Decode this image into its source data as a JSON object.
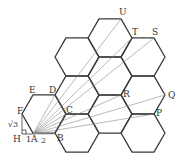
{
  "diagram": {
    "hex_edge": 22,
    "hex_centers": [
      [
        44,
        114
      ],
      [
        77,
        57
      ],
      [
        77,
        95
      ],
      [
        77,
        133
      ],
      [
        110,
        38
      ],
      [
        110,
        76
      ],
      [
        110,
        114
      ],
      [
        143,
        57
      ],
      [
        143,
        95
      ],
      [
        143,
        133
      ]
    ],
    "origin": {
      "label": "A",
      "x": 33,
      "y": 134
    },
    "points": [
      {
        "label": "B",
        "x": 55,
        "y": 134,
        "lx": 57,
        "ly": 141
      },
      {
        "label": "C",
        "x": 66,
        "y": 114,
        "lx": 66,
        "ly": 113
      },
      {
        "label": "D",
        "x": 55,
        "y": 95,
        "lx": 49,
        "ly": 93
      },
      {
        "label": "E",
        "x": 33,
        "y": 95,
        "lx": 29,
        "ly": 93
      },
      {
        "label": "F",
        "x": 22,
        "y": 114,
        "lx": 17,
        "ly": 114
      },
      {
        "label": "P",
        "x": 154,
        "y": 114,
        "lx": 156,
        "ly": 116
      },
      {
        "label": "Q",
        "x": 165,
        "y": 95,
        "lx": 168,
        "ly": 98
      },
      {
        "label": "R",
        "x": 121,
        "y": 95,
        "lx": 123,
        "ly": 97
      },
      {
        "label": "S",
        "x": 154,
        "y": 38,
        "lx": 152,
        "ly": 35
      },
      {
        "label": "T",
        "x": 132,
        "y": 38,
        "lx": 132,
        "ly": 35
      },
      {
        "label": "U",
        "x": 121,
        "y": 19,
        "lx": 119,
        "ly": 15
      }
    ],
    "rays_to": [
      "B",
      "C",
      "D",
      "P",
      "Q",
      "R",
      "S",
      "T",
      "U"
    ],
    "aux_labels": {
      "H": "H",
      "sqrt3": "√3",
      "one": "1",
      "two": "2"
    }
  }
}
